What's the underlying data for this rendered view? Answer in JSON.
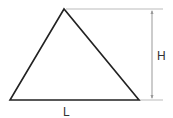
{
  "diagram": {
    "type": "triangle-dimensions",
    "labels": {
      "base": "L",
      "height": "H"
    },
    "colors": {
      "shape_stroke": "#222222",
      "dimension_line": "#bbbbbb",
      "text": "#333333"
    }
  }
}
